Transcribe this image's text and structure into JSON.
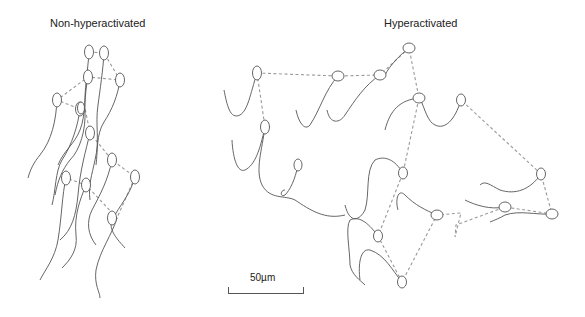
{
  "panels": {
    "left": {
      "title": "Non-hyperactivated"
    },
    "right": {
      "title": "Hyperactivated"
    }
  },
  "scale_bar": {
    "label": "50µm",
    "length_um": 50
  },
  "colors": {
    "tail": "#555555",
    "track": "#999999",
    "text": "#222222"
  }
}
